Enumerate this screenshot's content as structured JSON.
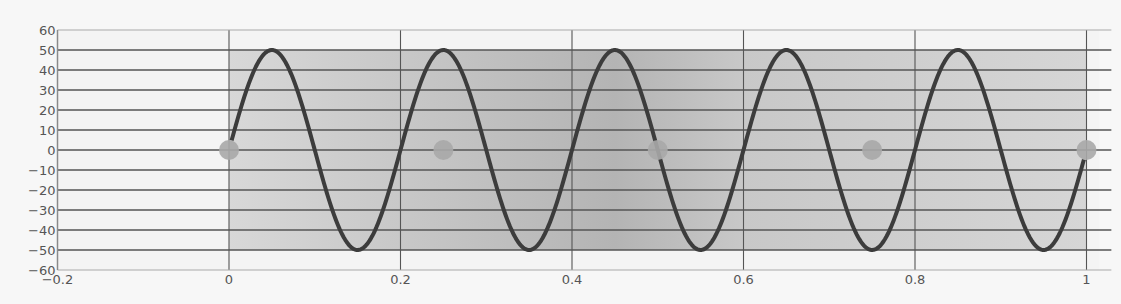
{
  "chart_data": {
    "type": "line",
    "title": "",
    "xlabel": "",
    "ylabel": "",
    "xlim": [
      -0.2,
      1.015
    ],
    "ylim": [
      -60,
      60
    ],
    "grid": {
      "horizontal": true,
      "vertical": true
    },
    "legend": null,
    "x_ticks": [
      -0.2,
      0,
      0.2,
      0.4,
      0.6,
      0.8,
      1
    ],
    "x_tick_labels": [
      "-0.2",
      "0",
      "0.2",
      "0.4",
      "0.6",
      "0.8",
      "1"
    ],
    "y_ticks": [
      60,
      50,
      40,
      30,
      20,
      10,
      0,
      -10,
      -20,
      -30,
      -40,
      -50,
      -60
    ],
    "y_tick_labels": [
      "60",
      "50",
      "40",
      "30",
      "20",
      "10",
      "0",
      "-10",
      "-20",
      "-30",
      "-40",
      "-50",
      "-60"
    ],
    "shaded_band": {
      "x_range": [
        0,
        1
      ],
      "y_range": [
        -50,
        50
      ],
      "gradient_stops": [
        {
          "x": 0.0,
          "color": "#d8d8d8"
        },
        {
          "x": 0.45,
          "color": "#b4b4b4"
        },
        {
          "x": 0.6,
          "color": "#c8c8c8"
        },
        {
          "x": 1.0,
          "color": "#d6d6d6"
        }
      ]
    },
    "series": [
      {
        "name": "sine",
        "kind": "line",
        "function": "50*sin(2*pi*5*x)",
        "amplitude": 50,
        "frequency": 5,
        "x_range": [
          0.003,
          0.997
        ],
        "color": "#3c3c3c",
        "line_width": 4,
        "peaks_x": [
          0.05,
          0.25,
          0.45,
          0.65,
          0.85
        ],
        "troughs_x": [
          0.15,
          0.35,
          0.55,
          0.75,
          0.95
        ]
      },
      {
        "name": "markers",
        "kind": "scatter",
        "x": [
          0,
          0.25,
          0.5,
          0.75,
          1
        ],
        "y": [
          0,
          0,
          0,
          0,
          0
        ],
        "color": "#a8a8a8",
        "radius": 10
      }
    ]
  },
  "colors": {
    "background": "#f7f7f7",
    "plot_background": "#f4f4f4",
    "grid_line": "#555555",
    "axis_line": "#8a8a8a",
    "tick_label": "#555555"
  }
}
